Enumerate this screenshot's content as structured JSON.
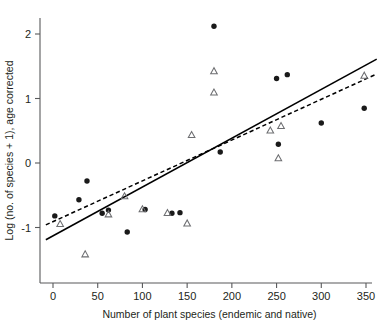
{
  "chart_data": {
    "type": "scatter",
    "title": "",
    "xlabel": "Number of plant species (endemic and native)",
    "ylabel": "Log (no. of species + 1), age corrected",
    "xlim": [
      -12,
      366
    ],
    "ylim": [
      -1.62,
      2.42
    ],
    "xticks": [
      0,
      50,
      100,
      150,
      200,
      250,
      300,
      350
    ],
    "xtick_labels": [
      "0",
      "50",
      "100",
      "150",
      "200",
      "250",
      "300",
      "350"
    ],
    "yticks": [
      -1,
      0,
      1,
      2
    ],
    "ytick_labels": [
      "-1",
      "0",
      "1",
      "2"
    ],
    "grid": false,
    "legend": "none",
    "series": [
      {
        "name": "filled-circles",
        "marker": "filled-circle",
        "color": "#1a1a1a",
        "points": [
          [
            2,
            -0.82
          ],
          [
            29,
            -0.57
          ],
          [
            38,
            -0.28
          ],
          [
            55,
            -0.78
          ],
          [
            62,
            -0.73
          ],
          [
            83,
            -1.07
          ],
          [
            103,
            -0.72
          ],
          [
            133,
            -0.78
          ],
          [
            142,
            -0.77
          ],
          [
            180,
            2.12
          ],
          [
            187,
            0.17
          ],
          [
            250,
            1.31
          ],
          [
            262,
            1.37
          ],
          [
            252,
            0.29
          ],
          [
            300,
            0.62
          ],
          [
            348,
            0.85
          ]
        ]
      },
      {
        "name": "open-triangles",
        "marker": "open-triangle",
        "color": "#6d6e71",
        "points": [
          [
            8,
            -0.95
          ],
          [
            36,
            -1.42
          ],
          [
            62,
            -0.8
          ],
          [
            80,
            -0.52
          ],
          [
            100,
            -0.72
          ],
          [
            128,
            -0.78
          ],
          [
            150,
            -0.94
          ],
          [
            155,
            0.43
          ],
          [
            180,
            1.42
          ],
          [
            180,
            1.09
          ],
          [
            243,
            0.5
          ],
          [
            255,
            0.57
          ],
          [
            252,
            0.07
          ],
          [
            348,
            1.35
          ]
        ]
      }
    ],
    "fit_lines": [
      {
        "name": "solid-regression-line",
        "style": "solid",
        "x": [
          -8,
          362
        ],
        "y": [
          -1.19,
          1.61
        ]
      },
      {
        "name": "dashed-regression-line",
        "style": "dashed",
        "x": [
          -8,
          362
        ],
        "y": [
          -0.96,
          1.38
        ]
      }
    ]
  }
}
